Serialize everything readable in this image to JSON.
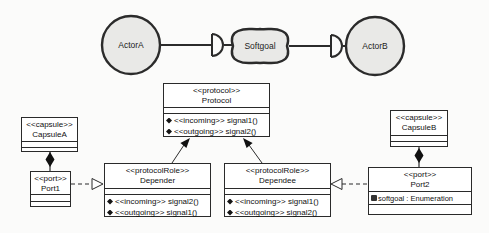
{
  "colors": {
    "background": "#fbfbfa",
    "actor_fill": "#e9e9e7",
    "box_fill": "#ffffff",
    "stroke": "#2b2b2b"
  },
  "istar": {
    "actor_a": "ActorA",
    "softgoal": "Softgoal",
    "actor_b": "ActorB"
  },
  "uml": {
    "capsule_a": {
      "stereotype": "<<capsule>>",
      "name": "CapsuleA"
    },
    "port1": {
      "stereotype": "<<port>>",
      "name": "Port1"
    },
    "protocol": {
      "stereotype": "<<protocol>>",
      "name": "Protocol",
      "operations": [
        "<<incoming>> signal1()",
        "<<outgoing>> signal2()"
      ]
    },
    "depender": {
      "stereotype": "<<protocolRole>>",
      "name": "Depender",
      "operations": [
        "<<incoming>> signal2()",
        "<<outgoing>> signal1()"
      ]
    },
    "dependee": {
      "stereotype": "<<protocolRole>>",
      "name": "Dependee",
      "operations": [
        "<<incoming>> signal1()",
        "<<outgoing>> signal2()"
      ]
    },
    "capsule_b": {
      "stereotype": "<<capsule>>",
      "name": "CapsuleB"
    },
    "port2": {
      "stereotype": "<<port>>",
      "name": "Port2",
      "attribute": "softgoal : Enumeration"
    }
  }
}
